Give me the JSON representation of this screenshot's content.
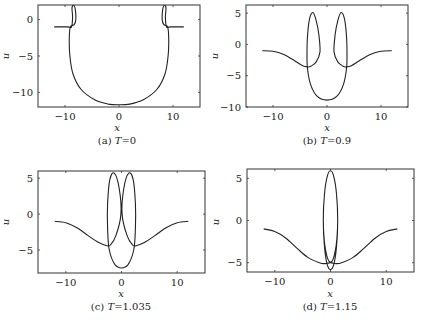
{
  "chart_data": [
    {
      "type": "line",
      "id": "a",
      "caption": "(a) T=0",
      "caption_prefix": "(a)",
      "caption_T": "T",
      "caption_value": "=0",
      "xlabel": "x",
      "ylabel": "u",
      "xlim": [
        -15,
        15
      ],
      "ylim": [
        -12,
        2
      ],
      "xticks": [
        -10,
        0,
        10
      ],
      "yticks": [
        0,
        -5,
        -10
      ],
      "xtick_labels": [
        "−10",
        "0",
        "10"
      ],
      "ytick_labels": [
        "0",
        "−5",
        "−10"
      ],
      "grid": false,
      "box": {
        "left": 38,
        "top": 5,
        "right": 200,
        "bottom": 107
      },
      "caption_pos": {
        "x": 117,
        "y": 144
      },
      "xlabel_pos": {
        "x": 117,
        "y": 131
      },
      "ylabel_pos": {
        "x": 9,
        "y": 56
      },
      "series": [
        {
          "name": "u(x)",
          "points": [
            [
              -12,
              -1
            ],
            [
              -9.5,
              -1
            ],
            [
              -8.8,
              -1
            ],
            [
              -8.6,
              0.3
            ],
            [
              -8.7,
              1.6
            ],
            [
              -8.4,
              2.0
            ],
            [
              -8.1,
              1.4
            ],
            [
              -8.0,
              0.0
            ],
            [
              -8.3,
              -0.7
            ],
            [
              -9.0,
              -1.0
            ],
            [
              -9.2,
              -2.5
            ],
            [
              -9.1,
              -5
            ],
            [
              -8.5,
              -7.5
            ],
            [
              -7,
              -9.6
            ],
            [
              -4.5,
              -11.0
            ],
            [
              -2,
              -11.6
            ],
            [
              0,
              -11.7
            ],
            [
              2,
              -11.6
            ],
            [
              4.5,
              -11.0
            ],
            [
              7,
              -9.6
            ],
            [
              8.5,
              -7.5
            ],
            [
              9.1,
              -5
            ],
            [
              9.2,
              -2.5
            ],
            [
              9.0,
              -1.0
            ],
            [
              8.3,
              -0.7
            ],
            [
              8.0,
              0.0
            ],
            [
              8.1,
              1.4
            ],
            [
              8.4,
              2.0
            ],
            [
              8.7,
              1.6
            ],
            [
              8.6,
              0.3
            ],
            [
              8.8,
              -1
            ],
            [
              9.5,
              -1
            ],
            [
              12,
              -1
            ]
          ]
        }
      ]
    },
    {
      "type": "line",
      "id": "b",
      "caption": "(b) T=0.9",
      "caption_prefix": "(b)",
      "caption_T": "T",
      "caption_value": "=0.9",
      "xlabel": "x",
      "ylabel": "u",
      "xlim": [
        -15,
        15
      ],
      "ylim": [
        -10,
        6.3
      ],
      "xticks": [
        -10,
        0,
        10
      ],
      "yticks": [
        5,
        0,
        -5,
        -10
      ],
      "xtick_labels": [
        "−10",
        "0",
        "10"
      ],
      "ytick_labels": [
        "5",
        "0",
        "−5",
        "−10"
      ],
      "grid": false,
      "box": {
        "left": 246,
        "top": 5,
        "right": 408,
        "bottom": 107
      },
      "caption_pos": {
        "x": 327,
        "y": 144
      },
      "xlabel_pos": {
        "x": 327,
        "y": 131
      },
      "ylabel_pos": {
        "x": 218,
        "y": 56
      },
      "series": [
        {
          "name": "u(x)",
          "points": [
            [
              -12,
              -1
            ],
            [
              -10,
              -1.1
            ],
            [
              -8,
              -1.6
            ],
            [
              -6,
              -2.6
            ],
            [
              -4.5,
              -3.4
            ],
            [
              -3.5,
              -3.6
            ],
            [
              -3.0,
              -3.5
            ],
            [
              -2.0,
              -2.8
            ],
            [
              -1.3,
              -1.2
            ],
            [
              -1.5,
              1.5
            ],
            [
              -2.0,
              3.8
            ],
            [
              -2.6,
              5.1
            ],
            [
              -3.2,
              4.2
            ],
            [
              -3.6,
              1.5
            ],
            [
              -3.7,
              -1.5
            ],
            [
              -3.6,
              -4
            ],
            [
              -3.0,
              -6.5
            ],
            [
              -1.8,
              -8.3
            ],
            [
              0,
              -8.9
            ],
            [
              1.8,
              -8.3
            ],
            [
              3.0,
              -6.5
            ],
            [
              3.6,
              -4
            ],
            [
              3.7,
              -1.5
            ],
            [
              3.6,
              1.5
            ],
            [
              3.2,
              4.2
            ],
            [
              2.6,
              5.1
            ],
            [
              2.0,
              3.8
            ],
            [
              1.5,
              1.5
            ],
            [
              1.3,
              -1.2
            ],
            [
              2.0,
              -2.8
            ],
            [
              3.0,
              -3.5
            ],
            [
              3.5,
              -3.6
            ],
            [
              4.5,
              -3.4
            ],
            [
              6,
              -2.6
            ],
            [
              8,
              -1.6
            ],
            [
              10,
              -1.1
            ],
            [
              12,
              -1
            ]
          ]
        }
      ]
    },
    {
      "type": "line",
      "id": "c",
      "caption": "(c) T=1.035",
      "caption_prefix": "(c)",
      "caption_T": "T",
      "caption_value": "=1.035",
      "xlabel": "x",
      "ylabel": "u",
      "xlim": [
        -15,
        15
      ],
      "ylim": [
        -8.2,
        6
      ],
      "xticks": [
        -10,
        0,
        10
      ],
      "yticks": [
        5,
        0,
        -5
      ],
      "xtick_labels": [
        "−10",
        "0",
        "10"
      ],
      "ytick_labels": [
        "5",
        "0",
        "−5"
      ],
      "grid": false,
      "box": {
        "left": 38,
        "top": 171,
        "right": 205,
        "bottom": 273
      },
      "caption_pos": {
        "x": 121,
        "y": 310
      },
      "xlabel_pos": {
        "x": 121,
        "y": 297
      },
      "ylabel_pos": {
        "x": 9,
        "y": 222
      },
      "series": [
        {
          "name": "u(x)",
          "points": [
            [
              -12,
              -1
            ],
            [
              -10,
              -1.2
            ],
            [
              -8,
              -1.9
            ],
            [
              -6,
              -3.0
            ],
            [
              -4,
              -4.0
            ],
            [
              -2.6,
              -4.4
            ],
            [
              -2.0,
              -4.3
            ],
            [
              -1.0,
              -3.0
            ],
            [
              -0.1,
              0
            ],
            [
              -0.4,
              3.5
            ],
            [
              -1.3,
              5.7
            ],
            [
              -2.1,
              4.8
            ],
            [
              -2.5,
              1.5
            ],
            [
              -2.5,
              -2
            ],
            [
              -2.2,
              -5
            ],
            [
              -1.2,
              -7.0
            ],
            [
              0,
              -7.5
            ],
            [
              1.2,
              -7.0
            ],
            [
              2.2,
              -5
            ],
            [
              2.5,
              -2
            ],
            [
              2.5,
              1.5
            ],
            [
              2.1,
              4.8
            ],
            [
              1.3,
              5.7
            ],
            [
              0.4,
              3.5
            ],
            [
              0.1,
              0
            ],
            [
              1.0,
              -3.0
            ],
            [
              2.0,
              -4.3
            ],
            [
              2.6,
              -4.4
            ],
            [
              4,
              -4.0
            ],
            [
              6,
              -3.0
            ],
            [
              8,
              -1.9
            ],
            [
              10,
              -1.2
            ],
            [
              12,
              -1
            ]
          ]
        }
      ]
    },
    {
      "type": "line",
      "id": "d",
      "caption": "(d) T=1.15",
      "caption_prefix": "(d)",
      "caption_T": "T",
      "caption_value": "=1.15",
      "xlabel": "x",
      "ylabel": "u",
      "xlim": [
        -15,
        15
      ],
      "ylim": [
        -6.1,
        6.1
      ],
      "xticks": [
        -10,
        0,
        10
      ],
      "yticks": [
        5,
        0,
        -5
      ],
      "xtick_labels": [
        "−10",
        "0",
        "10"
      ],
      "ytick_labels": [
        "5",
        "0",
        "−5"
      ],
      "grid": false,
      "box": {
        "left": 247,
        "top": 169,
        "right": 414,
        "bottom": 272
      },
      "caption_pos": {
        "x": 330,
        "y": 310
      },
      "xlabel_pos": {
        "x": 330,
        "y": 297
      },
      "ylabel_pos": {
        "x": 219,
        "y": 222
      },
      "series": [
        {
          "name": "u(x)",
          "points": [
            [
              -12,
              -1
            ],
            [
              -10,
              -1.3
            ],
            [
              -8,
              -2.1
            ],
            [
              -6,
              -3.3
            ],
            [
              -4,
              -4.4
            ],
            [
              -2,
              -5.0
            ],
            [
              -1.0,
              -5.1
            ],
            [
              0.3,
              -4.8
            ],
            [
              1.0,
              -3
            ],
            [
              1.3,
              0
            ],
            [
              1.1,
              3
            ],
            [
              0.6,
              5.2
            ],
            [
              0,
              5.9
            ],
            [
              -0.6,
              5.2
            ],
            [
              -1.1,
              3
            ],
            [
              -1.3,
              0
            ],
            [
              -1.1,
              -3
            ],
            [
              -0.6,
              -5.2
            ],
            [
              0,
              -5.8
            ],
            [
              0.6,
              -5.2
            ],
            [
              1.1,
              -3
            ],
            [
              1.3,
              0
            ],
            [
              1.1,
              3
            ],
            [
              0.6,
              5.2
            ],
            [
              0,
              5.9
            ],
            [
              -0.6,
              5.2
            ],
            [
              -1.1,
              3
            ],
            [
              -1.3,
              0
            ],
            [
              -1.0,
              -3
            ],
            [
              -0.3,
              -4.8
            ],
            [
              1.0,
              -5.1
            ],
            [
              2,
              -5.0
            ],
            [
              4,
              -4.4
            ],
            [
              6,
              -3.3
            ],
            [
              8,
              -2.1
            ],
            [
              10,
              -1.3
            ],
            [
              12,
              -1
            ]
          ]
        }
      ]
    }
  ]
}
